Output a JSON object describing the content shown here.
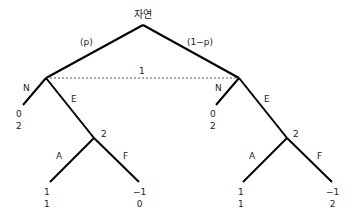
{
  "root": {
    "label": "자연"
  },
  "branches": {
    "left_prob": "(p)",
    "right_prob": "(1−p)"
  },
  "info_set": {
    "label": "1"
  },
  "left_subtree": {
    "action_n": "N",
    "action_e": "E",
    "node2_label": "2",
    "action_a": "A",
    "action_f": "F",
    "payoff_n": [
      "0",
      "2"
    ],
    "payoff_a": [
      "1",
      "1"
    ],
    "payoff_f": [
      "−1",
      "0"
    ]
  },
  "right_subtree": {
    "action_n": "N",
    "action_e": "E",
    "node2_label": "2",
    "action_a": "A",
    "action_f": "F",
    "payoff_n": [
      "0",
      "2"
    ],
    "payoff_a": [
      "1",
      "1"
    ],
    "payoff_f": [
      "−1",
      "2"
    ]
  },
  "colors": {
    "edge": "#000000",
    "info_set_line": "#555555"
  }
}
